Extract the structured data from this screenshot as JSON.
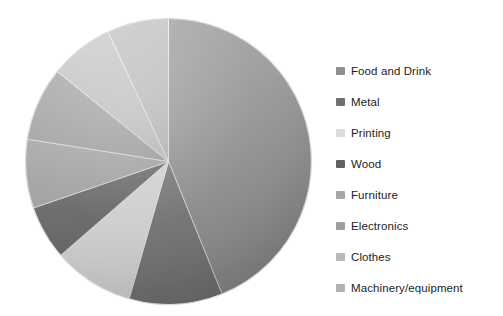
{
  "chart_data": {
    "type": "pie",
    "title": "",
    "subtitle": "",
    "xlabel": "",
    "ylabel": "",
    "legend_position": "right",
    "grid": false,
    "start_angle_deg": 0,
    "direction": "clockwise",
    "categories": [
      "Food and Drink",
      "Metal",
      "Printing",
      "Wood",
      "Furniture",
      "Electronics",
      "Clothes",
      "Machinery/equipment"
    ],
    "values": [
      43.9,
      10.6,
      9.2,
      6.1,
      7.8,
      8.3,
      7.2,
      6.9
    ],
    "units": "percent",
    "slices": [
      {
        "label": "Food and Drink",
        "value": 43.9,
        "angle_deg": 158,
        "color": "#9b9b9b",
        "swatch": "#8f8f8f"
      },
      {
        "label": "Metal",
        "value": 10.6,
        "angle_deg": 38,
        "color": "#7e7e7e",
        "swatch": "#6f6f6f"
      },
      {
        "label": "Printing",
        "value": 9.2,
        "angle_deg": 33,
        "color": "#ededed",
        "swatch": "#dcdcdc"
      },
      {
        "label": "Wood",
        "value": 6.1,
        "angle_deg": 22,
        "color": "#6d6d6d",
        "swatch": "#616161"
      },
      {
        "label": "Furniture",
        "value": 7.8,
        "angle_deg": 28,
        "color": "#b0b0b0",
        "swatch": "#a6a6a6"
      },
      {
        "label": "Electronics",
        "value": 8.3,
        "angle_deg": 30,
        "color": "#a8a8a8",
        "swatch": "#9e9e9e"
      },
      {
        "label": "Clothes",
        "value": 7.2,
        "angle_deg": 26,
        "color": "#cacaca",
        "swatch": "#b9b9b9"
      },
      {
        "label": "Machinery/equipment",
        "value": 6.9,
        "angle_deg": 25,
        "color": "#c2c2c2",
        "swatch": "#b2b2b2"
      }
    ]
  },
  "legend": {
    "items": [
      {
        "label": "Food and Drink",
        "swatch": "#8f8f8f"
      },
      {
        "label": "Metal",
        "swatch": "#6f6f6f"
      },
      {
        "label": "Printing",
        "swatch": "#dcdcdc"
      },
      {
        "label": "Wood",
        "swatch": "#616161"
      },
      {
        "label": "Furniture",
        "swatch": "#a6a6a6"
      },
      {
        "label": "Electronics",
        "swatch": "#9e9e9e"
      },
      {
        "label": "Clothes",
        "swatch": "#b9b9b9"
      },
      {
        "label": "Machinery/equipment",
        "swatch": "#b2b2b2"
      }
    ]
  }
}
